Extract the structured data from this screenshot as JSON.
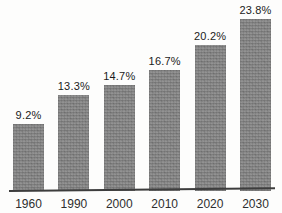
{
  "chart_data": {
    "type": "bar",
    "categories": [
      "1960",
      "1990",
      "2000",
      "2010",
      "2020",
      "2030"
    ],
    "values": [
      9.2,
      13.3,
      14.7,
      16.7,
      20.2,
      23.8
    ],
    "value_labels": [
      "9.2%",
      "13.3%",
      "14.7%",
      "16.7%",
      "20.2%",
      "23.8%"
    ],
    "title": "",
    "xlabel": "",
    "ylabel": "",
    "ylim": [
      0,
      26
    ],
    "grid": false,
    "legend": "none",
    "colors": {
      "bar_fill": "#8c8c8c",
      "axis_line": "#3d3d3d",
      "value_label_text": "#1b1b1b",
      "tick_label_text": "#2e2e2e",
      "background": "#fdfdfc"
    }
  }
}
